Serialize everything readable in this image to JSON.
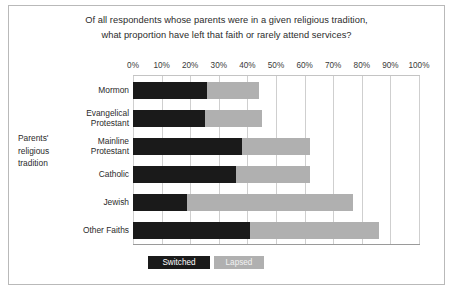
{
  "chart_data": {
    "type": "bar",
    "orientation": "horizontal",
    "stacked": true,
    "title": "Of all respondents whose parents were in a given religious tradition, what proportion have left that faith or rarely attend services?",
    "title_lines": [
      "Of all respondents whose parents were in a given religious tradition,",
      "what proportion have left that faith or rarely attend services?"
    ],
    "xlabel": "",
    "ylabel": "Parents' religious tradition",
    "ylabel_lines": [
      "Parents'",
      "religious",
      "tradition"
    ],
    "xlim": [
      0,
      100
    ],
    "grid": true,
    "legend_position": "bottom",
    "categories": [
      "Mormon",
      "Evangelical Protestant",
      "Mainline Protestant",
      "Catholic",
      "Jewish",
      "Other Faiths"
    ],
    "category_lines": [
      [
        "Mormon"
      ],
      [
        "Evangelical",
        "Protestant"
      ],
      [
        "Mainline",
        "Protestant"
      ],
      [
        "Catholic"
      ],
      [
        "Jewish"
      ],
      [
        "Other Faiths"
      ]
    ],
    "series": [
      {
        "name": "Switched",
        "color": "#1a1a1a",
        "values": [
          26,
          25,
          38,
          36,
          19,
          41
        ]
      },
      {
        "name": "Lapsed",
        "color": "#b0b0b0",
        "values": [
          18,
          20,
          24,
          26,
          58,
          45
        ]
      }
    ],
    "totals": [
      44,
      45,
      62,
      62,
      77,
      86
    ],
    "tick_labels": [
      "0%",
      "10%",
      "20%",
      "30%",
      "40%",
      "50%",
      "60%",
      "70%",
      "80%",
      "90%",
      "100%"
    ],
    "tick_values": [
      0,
      10,
      20,
      30,
      40,
      50,
      60,
      70,
      80,
      90,
      100
    ]
  },
  "legend": {
    "items": [
      {
        "label": "Switched"
      },
      {
        "label": "Lapsed"
      }
    ]
  }
}
